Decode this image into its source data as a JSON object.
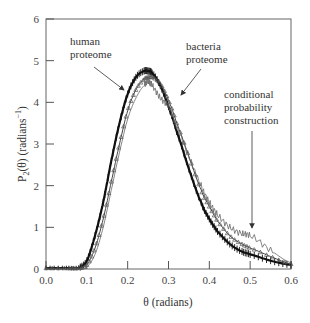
{
  "chart_data": {
    "type": "line",
    "title": "",
    "xlabel": "θ (radians)",
    "ylabel": "P₂(θ) (radians⁻¹)",
    "xlim": [
      0.0,
      0.6
    ],
    "ylim": [
      0,
      6
    ],
    "xticks": [
      "0.0",
      "0.1",
      "0.2",
      "0.3",
      "0.4",
      "0.5",
      "0.6"
    ],
    "yticks": [
      "0",
      "1",
      "2",
      "3",
      "4",
      "5",
      "6"
    ],
    "grid": false,
    "legend": "none (inline annotations)",
    "x": [
      0.0,
      0.05,
      0.08,
      0.1,
      0.12,
      0.14,
      0.16,
      0.18,
      0.2,
      0.22,
      0.24,
      0.25,
      0.26,
      0.28,
      0.3,
      0.32,
      0.35,
      0.38,
      0.4,
      0.42,
      0.45,
      0.48,
      0.5,
      0.55,
      0.6
    ],
    "series": [
      {
        "name": "human proteome",
        "style": "thick black line with error bars",
        "values": [
          0.02,
          0.02,
          0.03,
          0.2,
          0.8,
          1.6,
          2.6,
          3.5,
          4.2,
          4.6,
          4.75,
          4.75,
          4.7,
          4.4,
          3.9,
          3.3,
          2.4,
          1.6,
          1.2,
          0.9,
          0.6,
          0.42,
          0.35,
          0.2,
          0.1
        ]
      },
      {
        "name": "bacteria proteome",
        "style": "triangle markers",
        "values": [
          0.02,
          0.02,
          0.02,
          0.1,
          0.5,
          1.2,
          2.1,
          3.0,
          3.8,
          4.3,
          4.55,
          4.6,
          4.6,
          4.45,
          4.05,
          3.5,
          2.7,
          1.9,
          1.5,
          1.15,
          0.8,
          0.6,
          0.5,
          0.3,
          0.12
        ]
      },
      {
        "name": "conditional probability construction",
        "style": "thin line",
        "values": [
          0.0,
          0.0,
          0.0,
          0.05,
          0.35,
          1.0,
          1.9,
          2.8,
          3.6,
          4.1,
          4.4,
          4.5,
          4.4,
          4.1,
          3.9,
          3.4,
          2.7,
          2.0,
          1.6,
          1.3,
          1.0,
          0.85,
          0.8,
          0.45,
          0.15
        ]
      }
    ],
    "annotations": [
      {
        "text": [
          "human",
          "proteome"
        ],
        "arrow_to": [
          0.2,
          4.15
        ]
      },
      {
        "text": [
          "bacteria",
          "proteome"
        ],
        "arrow_to": [
          0.31,
          3.85
        ]
      },
      {
        "text": [
          "conditional",
          "probability",
          "construction"
        ],
        "arrow_to": [
          0.5,
          0.55
        ]
      }
    ]
  },
  "labels": {
    "xlabel": "θ (radians)",
    "ylabel_main": "P",
    "ylabel_sub": "2",
    "ylabel_rest": "(θ) (radians",
    "ylabel_sup": "−1",
    "ylabel_close": ")",
    "anno_human_1": "human",
    "anno_human_2": "proteome",
    "anno_bacteria_1": "bacteria",
    "anno_bacteria_2": "proteome",
    "anno_cond_1": "conditional",
    "anno_cond_2": "probability",
    "anno_cond_3": "construction"
  }
}
